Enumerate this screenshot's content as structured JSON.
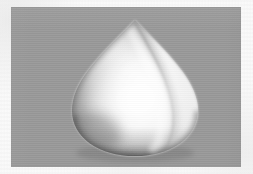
{
  "image": {
    "title": "3D rendered teardrop solid on gray background",
    "width": 253,
    "height": 174,
    "caption": "",
    "matte_color": "#fbfbfb"
  },
  "render_panel": {
    "label": "render-canvas",
    "background_color": "#9a9a9a",
    "x": 11,
    "y": 7,
    "width": 230,
    "height": 160
  },
  "object": {
    "name": "teardrop-solid",
    "description": "Smooth shaded solid of revolution, pointed apex at top, broad rounded base",
    "surface_color": "#fdfdfd",
    "shadow_color": "#5e5e5e",
    "midtone_color": "#c9c9c9",
    "highlight_color": "#ffffff",
    "apex_x": 124,
    "apex_y": 13,
    "widest_y": 98,
    "left_x": 61,
    "right_x": 189,
    "base_y": 148,
    "seam_label": "surface-crease"
  },
  "lighting": {
    "key_light": "upper-right",
    "specular_center_x": 128,
    "specular_center_y": 92,
    "terminator_side": "left"
  }
}
